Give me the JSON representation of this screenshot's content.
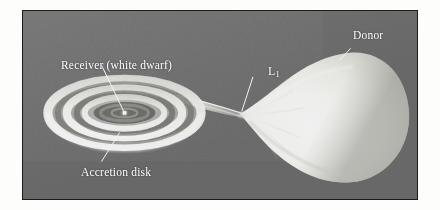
{
  "figure": {
    "background_color": "#6e6e6e",
    "frame_color": "#1c1c1c",
    "label_color": "#ffffff",
    "leader_color": "#ffffff"
  },
  "labels": {
    "receiver": "Receiver (white dwarf)",
    "accretion_disk": "Accretion disk",
    "donor": "Donor",
    "l1_base": "L",
    "l1_subscript": "1"
  },
  "objects": {
    "white_dwarf": {
      "name": "white-dwarf-point",
      "description": "Bright point source at the centre of the accretion disk",
      "color": "#ffffff"
    },
    "accretion_disk": {
      "name": "accretion-disk",
      "description": "Nested elliptical rings of infalling material seen nearly edge-on",
      "ring_count": 5,
      "bright_color": "#f2f2f0",
      "dark_color": "#5d5d5d"
    },
    "donor_star": {
      "name": "donor-star",
      "description": "Roche-lobe filling teardrop shaped companion star",
      "color": "#fbfbf9"
    },
    "accretion_stream": {
      "name": "accretion-stream",
      "description": "Gas stream flowing from the donor through L1 onto the disk",
      "color": "#e8e8e6"
    },
    "l1_point": {
      "name": "l1-lagrange-point",
      "description": "Inner Lagrange point where the stream leaves the donor"
    }
  }
}
